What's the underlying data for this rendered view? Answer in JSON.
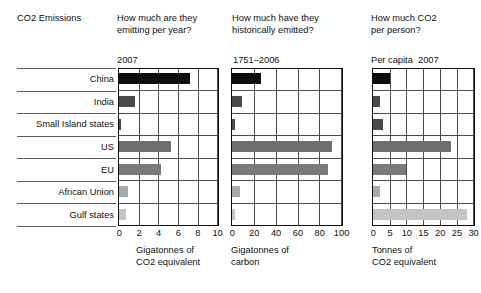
{
  "header": {
    "title": "CO2 Emissions",
    "question_1": "How much are they\nemitting per year?",
    "question_2": "How much have they\nhistorically emitted?",
    "question_3": "How much CO2\nper person?"
  },
  "subheaders": {
    "panel_1": "2007",
    "panel_2": "1751–2006",
    "panel_3": "Per capita  2007"
  },
  "rows": [
    {
      "label": "China"
    },
    {
      "label": "India"
    },
    {
      "label": "Small Island states"
    },
    {
      "label": "US"
    },
    {
      "label": "EU"
    },
    {
      "label": "African Union"
    },
    {
      "label": "Gulf states"
    }
  ],
  "colors": {
    "china": "#0d0d0d",
    "india": "#4a4a4a",
    "small_island": "#4a4a4a",
    "us": "#6e6e6e",
    "eu": "#7a7a7a",
    "african_union": "#a8a8a8",
    "gulf_states": "#c4c4c4",
    "axis": "#111111",
    "grid": "#4a4a4a"
  },
  "chart_data": [
    {
      "type": "bar",
      "title": "How much are they emitting per year?",
      "subtitle": "2007",
      "orientation": "horizontal",
      "categories": [
        "China",
        "India",
        "Small Island states",
        "US",
        "EU",
        "African Union",
        "Gulf states"
      ],
      "values": [
        7.2,
        1.6,
        0.2,
        5.3,
        4.3,
        0.9,
        0.7
      ],
      "xlabel": "Gigatonnes of\nCO2 equivalent",
      "ylabel": "",
      "xlim": [
        0,
        10
      ],
      "xticks": [
        0,
        2,
        4,
        6,
        8,
        10
      ],
      "grid": true,
      "legend": "none"
    },
    {
      "type": "bar",
      "title": "How much have they historically emitted?",
      "subtitle": "1751–2006",
      "orientation": "horizontal",
      "categories": [
        "China",
        "India",
        "Small Island states",
        "US",
        "EU",
        "African Union",
        "Gulf states"
      ],
      "values": [
        27,
        9,
        3,
        92,
        88,
        7,
        3
      ],
      "xlabel": "Gigatonnes of\ncarbon",
      "ylabel": "",
      "xlim": [
        0,
        100
      ],
      "xticks": [
        0,
        20,
        40,
        60,
        80,
        100
      ],
      "grid": true,
      "legend": "none"
    },
    {
      "type": "bar",
      "title": "How much CO2 per person?",
      "subtitle": "Per capita  2007",
      "orientation": "horizontal",
      "categories": [
        "China",
        "India",
        "Small Island states",
        "US",
        "EU",
        "African Union",
        "Gulf states"
      ],
      "values": [
        5.0,
        2.0,
        3.0,
        23.5,
        10.0,
        2.0,
        28.0
      ],
      "xlabel": "Tonnes of\nCO2 equivalent",
      "ylabel": "",
      "xlim": [
        0,
        30
      ],
      "xticks": [
        0,
        5,
        10,
        15,
        20,
        25,
        30
      ],
      "grid": true,
      "legend": "none"
    }
  ]
}
